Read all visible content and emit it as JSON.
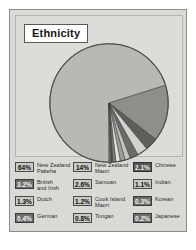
{
  "chart_data": {
    "type": "pie",
    "title": "Ethnicity",
    "xlabel": "",
    "ylabel": "",
    "legend_position": "bottom",
    "grid": false,
    "unit": "%",
    "categories": [
      "New Zealand Pakeha",
      "New Zealand Maori",
      "British and Irish",
      "Samoan",
      "Chinese",
      "Dutch",
      "Cook Island Maori",
      "Indian",
      "Tongan",
      "German",
      "Korean",
      "Japanese"
    ],
    "values": [
      64,
      14,
      3.2,
      2.6,
      2.1,
      1.3,
      1.2,
      1.1,
      0.8,
      0.4,
      0.3,
      0.2
    ],
    "slices": [
      {
        "label": "New Zealand Pakeha",
        "value": 64,
        "display": "64%",
        "color": "#b8b8b5"
      },
      {
        "label": "New Zealand Maori",
        "value": 14,
        "display": "14%",
        "color": "#8e8e8b"
      },
      {
        "label": "British and Irish",
        "value": 3.2,
        "display": "3.2%",
        "color": "#5e5e5c"
      },
      {
        "label": "Samoan",
        "value": 2.6,
        "display": "2.6%",
        "color": "#d2d2cf"
      },
      {
        "label": "Chinese",
        "value": 2.1,
        "display": "2.1%",
        "color": "#6b6b69"
      },
      {
        "label": "Dutch",
        "value": 1.3,
        "display": "1.3%",
        "color": "#c4c4c1"
      },
      {
        "label": "Cook Island Maori",
        "value": 1.2,
        "display": "1.2%",
        "color": "#9c9c99"
      },
      {
        "label": "Indian",
        "value": 1.1,
        "display": "1.1%",
        "color": "#e2e2df"
      },
      {
        "label": "Tongan",
        "value": 0.8,
        "display": "0.8%",
        "color": "#7a7a78"
      },
      {
        "label": "German",
        "value": 0.4,
        "display": "0.4%",
        "color": "#4f4f4d"
      },
      {
        "label": "Korean",
        "value": 0.3,
        "display": "0.3%",
        "color": "#868683"
      },
      {
        "label": "Japanese",
        "value": 0.2,
        "display": "0.2%",
        "color": "#bcbcb9"
      }
    ]
  },
  "title": {
    "text": "Ethnicity"
  },
  "legend": {
    "entries": [
      {
        "pct": "64%",
        "label": "New Zealand\nPakeha",
        "swatch": "light",
        "column": 1
      },
      {
        "pct": "14%",
        "label": "New Zealand\nMaori",
        "swatch": "light",
        "column": 2
      },
      {
        "pct": "2.1%",
        "label": "Chinese",
        "swatch": "darker",
        "column": 3
      },
      {
        "pct": "3.2%",
        "label": "British\nand Irish",
        "swatch": "dark",
        "column": 1
      },
      {
        "pct": "2.6%",
        "label": "Samoan",
        "swatch": "light",
        "column": 2
      },
      {
        "pct": "1.1%",
        "label": "Indian",
        "swatch": "light",
        "column": 3
      },
      {
        "pct": "1.3%",
        "label": "Dutch",
        "swatch": "light",
        "column": 1
      },
      {
        "pct": "1.2%",
        "label": "Cook Island\nMaori",
        "swatch": "light",
        "column": 2
      },
      {
        "pct": "0.3%",
        "label": "Korean",
        "swatch": "dark",
        "column": 3
      },
      {
        "pct": "0.4%",
        "label": "German",
        "swatch": "dark",
        "column": 1
      },
      {
        "pct": "0.8%",
        "label": "Tongan",
        "swatch": "light",
        "column": 2
      },
      {
        "pct": "0.2%",
        "label": "Japanese",
        "swatch": "dark",
        "column": 3
      }
    ]
  },
  "colors": {
    "panel_background": "#d9d9d6",
    "plot_background": "#dcdcd9",
    "panel_border": "#8e8e8b",
    "pie_outline": "#4a4a48",
    "page_background": "#ffffff"
  }
}
